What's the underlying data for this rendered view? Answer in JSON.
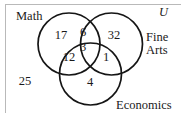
{
  "diagram": {
    "universe_label": "U",
    "sets": [
      {
        "key": "math",
        "label": "Math"
      },
      {
        "key": "fine_arts",
        "label": "Fine\nArts"
      },
      {
        "key": "economics",
        "label": "Economics"
      }
    ],
    "set_labels": {
      "math": "Math",
      "fine_arts_line1": "Fine",
      "fine_arts_line2": "Arts",
      "economics": "Economics"
    },
    "regions": [
      {
        "key": "math_only",
        "label": "Math only",
        "value": "17"
      },
      {
        "key": "fine_arts_only",
        "label": "Fine Arts only",
        "value": "32"
      },
      {
        "key": "economics_only",
        "label": "Economics only",
        "value": "4"
      },
      {
        "key": "math_fine_arts",
        "label": "Math and Fine Arts only",
        "value": "6"
      },
      {
        "key": "math_economics",
        "label": "Math and Economics only",
        "value": "12"
      },
      {
        "key": "fine_arts_economics",
        "label": "Fine Arts and Economics only",
        "value": "1"
      },
      {
        "key": "all_three",
        "label": "Math, Fine Arts and Economics",
        "value": "3"
      },
      {
        "key": "outside_all",
        "label": "Outside all three sets",
        "value": "25"
      }
    ],
    "counts": {
      "math_only": "17",
      "fine_arts_only": "32",
      "economics_only": "4",
      "math_fine_arts": "6",
      "math_economics": "12",
      "fine_arts_economics": "1",
      "all_three": "3",
      "outside_all": "25"
    },
    "style": {
      "stroke_color": "#151515",
      "text_color": "#1a1a1a",
      "border_color": "#b9b9b9",
      "background": "#ffffff"
    }
  }
}
